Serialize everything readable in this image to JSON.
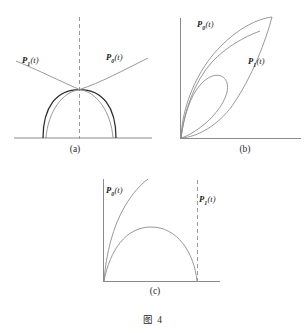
{
  "figure": {
    "caption": "图 4",
    "background_color": "#ffffff",
    "line_color": "#8a8a8a",
    "dark_curve_color": "#2a2a2a",
    "dashed_color": "#9a9a9a"
  },
  "panels": [
    {
      "id": "a",
      "caption": "(a)",
      "labels": [
        {
          "name": "p1-label",
          "base": "P",
          "sub": "1",
          "arg": "(t)"
        },
        {
          "name": "p0-label",
          "base": "P",
          "sub": "0",
          "arg": "(t)"
        }
      ],
      "elements": [
        "horizontal-baseline",
        "vertical-dashed-line",
        "dark-semicircular-dome",
        "thin-arc-left",
        "thin-arc-right",
        "rising-curve-right",
        "falling-curve-left"
      ]
    },
    {
      "id": "b",
      "caption": "(b)",
      "labels": [
        {
          "name": "p0-label",
          "base": "P",
          "sub": "0",
          "arg": "(t)"
        },
        {
          "name": "p1-label",
          "base": "P",
          "sub": "1",
          "arg": "(t)"
        }
      ],
      "elements": [
        "vertical-axis",
        "horizontal-axis",
        "outer-petal-loop",
        "inner-small-loop",
        "middle-loop"
      ]
    },
    {
      "id": "c",
      "caption": "(c)",
      "labels": [
        {
          "name": "p0-label",
          "base": "P",
          "sub": "0",
          "arg": "(t)"
        },
        {
          "name": "p1-label",
          "base": "P",
          "sub": "1",
          "arg": "(t)"
        }
      ],
      "elements": [
        "vertical-axis",
        "horizontal-axis",
        "rising-curve",
        "dome-arch",
        "vertical-dashed-line"
      ]
    }
  ]
}
